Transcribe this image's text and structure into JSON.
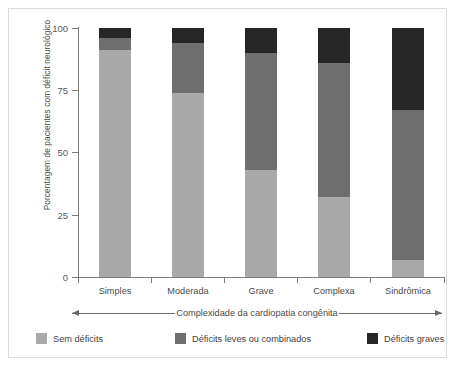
{
  "chart_data": {
    "type": "bar",
    "subtype": "stacked-bar-100-percent",
    "title": "",
    "xlabel": "Complexidade da cardiopatia congênita",
    "ylabel": "Porcentagem de pacientes com déficit neurológico",
    "categories": [
      "Simples",
      "Moderada",
      "Grave",
      "Complexa",
      "Sindrômica"
    ],
    "ylim": [
      0,
      100
    ],
    "yticks": [
      "0",
      "25",
      "50",
      "75",
      "100"
    ],
    "ytick_values": [
      0,
      25,
      50,
      75,
      100
    ],
    "grid": false,
    "legend_position": "bottom",
    "series": [
      {
        "name": "Sem déficits",
        "color": "#a9a9a9",
        "values": [
          91,
          74,
          43,
          32,
          7
        ]
      },
      {
        "name": "Déficits leves ou combinados",
        "color": "#6e6e6e",
        "values": [
          5,
          20,
          47,
          54,
          60
        ]
      },
      {
        "name": "Déficits graves",
        "color": "#262626",
        "values": [
          4,
          6,
          10,
          14,
          33
        ]
      }
    ]
  },
  "axis": {
    "y_title": "Porcentagem de pacientes com déficit neurológico",
    "x_caption": "Complexidade da cardiopatia congênita",
    "tick_0": "0",
    "tick_25": "25",
    "tick_50": "50",
    "tick_75": "75",
    "tick_100": "100"
  },
  "categories": {
    "c0": "Simples",
    "c1": "Moderada",
    "c2": "Grave",
    "c3": "Complexa",
    "c4": "Sindrômica"
  },
  "legend": {
    "items": [
      {
        "label": "Sem déficits",
        "color": "#a9a9a9"
      },
      {
        "label": "Déficits leves ou combinados",
        "color": "#6e6e6e"
      },
      {
        "label": "Déficits graves",
        "color": "#262626"
      }
    ]
  },
  "colors": {
    "no_deficit": "#a9a9a9",
    "mild_deficit": "#6e6e6e",
    "severe_deficit": "#262626",
    "axis": "#7d7d7d",
    "text": "#4a4a4a",
    "frame": "#dcdcdc",
    "background": "#ffffff"
  }
}
